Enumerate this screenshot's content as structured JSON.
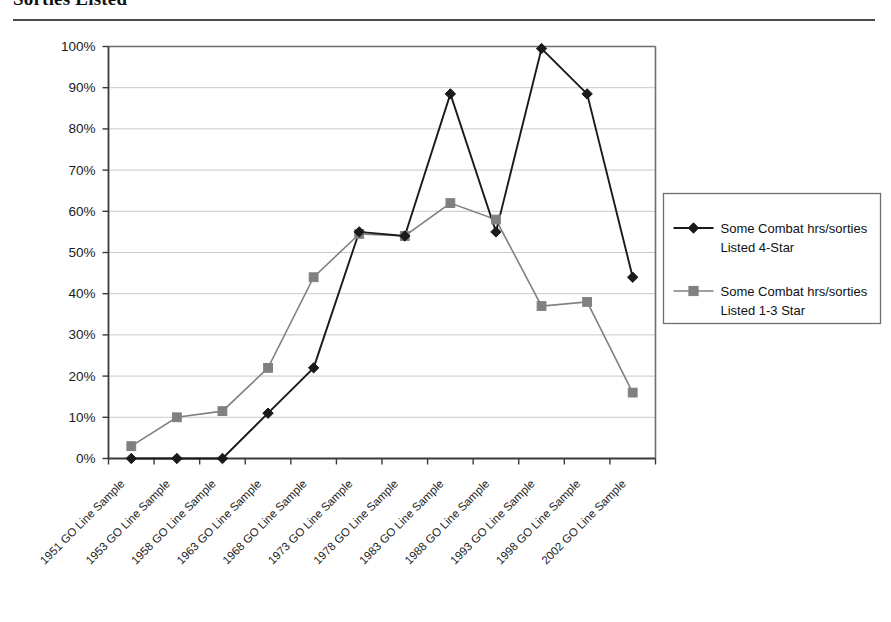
{
  "page": {
    "title": "Sorties Listed"
  },
  "chart_data": {
    "type": "line",
    "title": "Sorties Listed",
    "xlabel": "",
    "ylabel": "",
    "ylim": [
      0,
      100
    ],
    "ytick_labels": [
      "0%",
      "10%",
      "20%",
      "30%",
      "40%",
      "50%",
      "60%",
      "70%",
      "80%",
      "90%",
      "100%"
    ],
    "ytick_values": [
      0,
      10,
      20,
      30,
      40,
      50,
      60,
      70,
      80,
      90,
      100
    ],
    "grid": true,
    "legend_position": "right",
    "categories": [
      "1951 GO Line Sample",
      "1953 GO Line Sample",
      "1958 GO Line Sample",
      "1963 GO Line Sample",
      "1968 GO Line Sample",
      "1973 GO Line Sample",
      "1978 GO Line Sample",
      "1983 GO Line Sample",
      "1988 GO Line Sample",
      "1993 GO Line Sample",
      "1998 GO Line Sample",
      "2002 GO Line Sample"
    ],
    "series": [
      {
        "name": "Some Combat hrs/sorties Listed 4-Star",
        "name_line1": "Some Combat hrs/sorties",
        "name_line2": "Listed 4-Star",
        "color": "#1a1a1a",
        "marker": "diamond",
        "values": [
          0,
          0,
          0,
          11,
          22,
          55,
          54,
          88.5,
          55,
          99.5,
          88.5,
          44
        ]
      },
      {
        "name": "Some Combat hrs/sorties Listed 1-3 Star",
        "name_line1": "Some Combat hrs/sorties",
        "name_line2": "Listed 1-3 Star",
        "color": "#808080",
        "marker": "square",
        "values": [
          3,
          10,
          11.5,
          22,
          44,
          54.5,
          54,
          62,
          58,
          37,
          38,
          16
        ]
      }
    ]
  }
}
